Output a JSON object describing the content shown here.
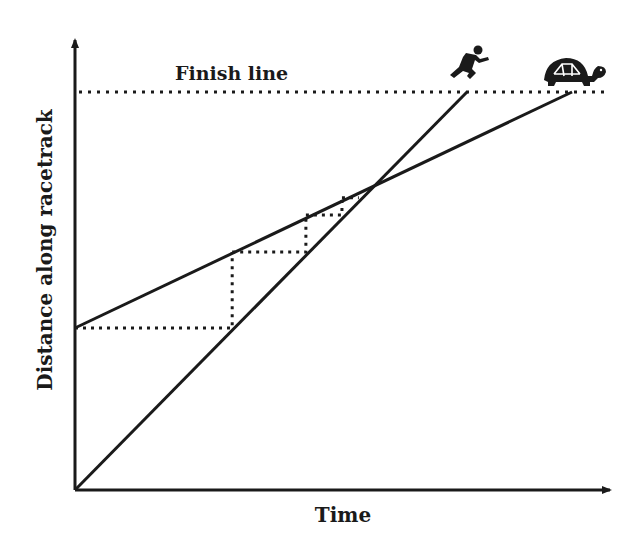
{
  "diagram": {
    "finish_label": "Finish line",
    "x_axis_label": "Time",
    "y_axis_label": "Distance along racetrack",
    "ink_color": "#1a1a1a",
    "runner_icon": "runner-icon",
    "tortoise_icon": "tortoise-icon"
  },
  "chart_data": {
    "type": "line",
    "xlabel": "Time",
    "ylabel": "Distance along racetrack",
    "xlim": [
      0,
      1.35
    ],
    "ylim": [
      0,
      1.1
    ],
    "grid": false,
    "finish_distance": 1.0,
    "annotations": [
      "Finish line"
    ],
    "series": [
      {
        "name": "runner",
        "points": [
          [
            0,
            0
          ],
          [
            1.0,
            1.0
          ]
        ]
      },
      {
        "name": "tortoise",
        "points": [
          [
            0,
            0.407
          ],
          [
            1.268,
            1.0
          ]
        ]
      }
    ],
    "zeno_steps": [
      [
        [
          0,
          0.407
        ],
        [
          0.401,
          0.407
        ],
        [
          0.401,
          0.598
        ]
      ],
      [
        [
          0.401,
          0.598
        ],
        [
          0.589,
          0.598
        ],
        [
          0.589,
          0.691
        ]
      ],
      [
        [
          0.589,
          0.691
        ],
        [
          0.681,
          0.691
        ],
        [
          0.681,
          0.734
        ]
      ],
      [
        [
          0.681,
          0.734
        ],
        [
          0.724,
          0.734
        ]
      ]
    ]
  }
}
